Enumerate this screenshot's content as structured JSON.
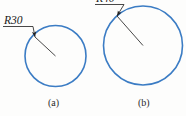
{
  "figure": {
    "background_color": "#fdfdfc",
    "circle_color": "#3b7cc4",
    "leader_color": "#333333",
    "text_color": "#1a1a1a",
    "subfigures": [
      {
        "caption": "(a)",
        "dimension_label": "R30",
        "radius_value": 30,
        "circle": {
          "cx": 55.5,
          "cy": 56,
          "r": 30.5
        },
        "leader": {
          "text_x": 4,
          "text_y": 24,
          "underline_x1": 3,
          "underline_x2": 33,
          "underline_y": 26.5,
          "arrow_x": 35,
          "arrow_y": 37
        },
        "radius_line": {
          "x1": 35,
          "y1": 37,
          "x2": 55.5,
          "y2": 56
        },
        "caption_x": 48,
        "caption_y": 106
      },
      {
        "caption": "(b)",
        "dimension_label": "R40",
        "radius_value": 40,
        "circle": {
          "cx": 143,
          "cy": 45.5,
          "r": 39.5
        },
        "leader": {
          "text_x": 96,
          "text_y": 2,
          "underline_x1": 95,
          "underline_x2": 124,
          "underline_y": 4.5,
          "arrow_x": 117,
          "arrow_y": 16
        },
        "radius_line": {
          "x1": 117,
          "y1": 16,
          "x2": 143,
          "y2": 45.5
        },
        "caption_x": 138,
        "caption_y": 106
      }
    ]
  }
}
